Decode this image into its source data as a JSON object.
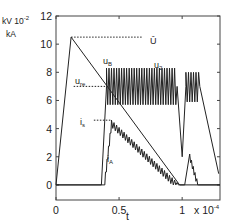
{
  "chart_data": {
    "type": "line",
    "title": "",
    "xlabel": "t",
    "x_multiplier": "x 10^-4",
    "ylabel": "kV 10^-2 / kA",
    "ylabel_lines": [
      "kV 10",
      "-2",
      "kA"
    ],
    "xlim": [
      0,
      1.3
    ],
    "ylim": [
      -1.07,
      12
    ],
    "xticks": [
      0,
      0.5,
      1
    ],
    "xtick_labels": [
      "0",
      "0.5",
      "1"
    ],
    "yticks": [
      0,
      2,
      4,
      6,
      8,
      10,
      12
    ],
    "ytick_labels": [
      "0",
      "2",
      "4",
      "6",
      "8",
      "10",
      "12"
    ],
    "grid": false,
    "legend": "none (inline annotations)",
    "series": [
      {
        "name": "u_B",
        "style": "solid",
        "points": [
          [
            0,
            0
          ],
          [
            0.12,
            10.5
          ],
          [
            0.98,
            0
          ],
          [
            1.3,
            0
          ]
        ]
      },
      {
        "name": "u_2",
        "style": "solid-oscillating",
        "segments": [
          {
            "t_start": 0.0,
            "t_end": 0.36,
            "value": 0
          },
          {
            "t_start": 0.36,
            "t_end": 0.4,
            "value_from": 0,
            "value_to": 7
          },
          {
            "t_start": 0.4,
            "t_end": 0.96,
            "oscillation": {
              "center": 7,
              "min": 5.7,
              "max": 8.3,
              "period": 0.02
            }
          },
          {
            "t_start": 0.96,
            "t_end": 1.0,
            "value_from": 7,
            "value_to": 2
          },
          {
            "t_start": 1.0,
            "t_end": 1.03,
            "value_from": 2,
            "value_to": 7
          },
          {
            "t_start": 1.03,
            "t_end": 1.14,
            "oscillation": {
              "center": 7,
              "min": 5.9,
              "max": 8.0,
              "period": 0.02
            }
          },
          {
            "t_start": 1.14,
            "t_end": 1.29,
            "value_from": 7,
            "value_to": 0.8
          }
        ]
      },
      {
        "name": "i_A",
        "style": "solid-sawtooth",
        "segments": [
          {
            "t_start": 0.0,
            "t_end": 0.38,
            "value": 0
          },
          {
            "t_start": 0.38,
            "t_end": 0.44,
            "value_from": 0,
            "value_to": 4.6,
            "steps": 5
          },
          {
            "t_start": 0.44,
            "t_end": 0.98,
            "sawtooth": {
              "from": 4.6,
              "to": 0,
              "period": 0.02,
              "amplitude": 0.5
            }
          },
          {
            "t_start": 0.98,
            "t_end": 1.02,
            "value": 0
          },
          {
            "t_start": 1.02,
            "t_end": 1.06,
            "value_from": 0,
            "value_to": 2.2
          },
          {
            "t_start": 1.06,
            "t_end": 1.13,
            "sawtooth": {
              "from": 2.2,
              "to": 0,
              "period": 0.015,
              "amplitude": 0.4
            }
          },
          {
            "t_start": 1.13,
            "t_end": 1.3,
            "value": 0
          }
        ]
      }
    ],
    "reference_lines": [
      {
        "name": "U_hat",
        "label": "Û",
        "y": 10.5,
        "x_from": 0.12,
        "x_to": 0.68,
        "style": "dotted"
      },
      {
        "name": "u_re",
        "label": "u_re",
        "y": 7.0,
        "x_from": 0.14,
        "x_to": 0.4,
        "style": "dotted"
      },
      {
        "name": "i_s",
        "label": "i_s",
        "y": 4.6,
        "x_from": 0.3,
        "x_to": 0.44,
        "style": "dotted"
      }
    ],
    "annotations": [
      {
        "text": "Û",
        "x": 0.7,
        "y": 10.5
      },
      {
        "text": "u_B",
        "x": 0.35,
        "y": 8.6
      },
      {
        "text": "u_re",
        "x": 0.13,
        "y": 7.3
      },
      {
        "text": "u_2",
        "x": 0.7,
        "y": 8.7
      },
      {
        "text": "i_s",
        "x": 0.16,
        "y": 4.6
      },
      {
        "text": "i_A",
        "x": 0.42,
        "y": 2.6
      }
    ]
  },
  "labels": {
    "y_unit_main": "kV 10",
    "y_unit_exp": "-2",
    "y_unit_second": "kA",
    "x_label": "t",
    "x_mult_base": "x 10",
    "x_mult_exp": "-4",
    "ann_Uhat": "Û",
    "ann_uB_main": "u",
    "ann_uB_sub": "B",
    "ann_ure_main": "u",
    "ann_ure_sub": "re",
    "ann_u2_main": "u",
    "ann_u2_sub": "2",
    "ann_is_main": "i",
    "ann_is_sub": "s",
    "ann_iA_main": "i",
    "ann_iA_sub": "A"
  },
  "colors": {
    "line": "#222222",
    "axis": "#444444",
    "background": "#ffffff"
  }
}
